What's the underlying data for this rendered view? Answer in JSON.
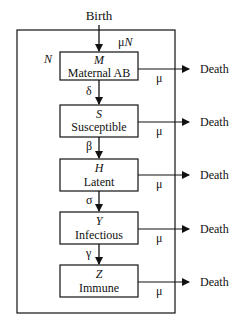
{
  "diagram": {
    "source_label": "Birth",
    "outer_label": "N",
    "birth_rate_label": "μN",
    "sink_label": "Death",
    "death_rate_label": "μ",
    "compartments": [
      {
        "symbol": "M",
        "name": "Maternal AB"
      },
      {
        "symbol": "S",
        "name": "Susceptible"
      },
      {
        "symbol": "H",
        "name": "Latent"
      },
      {
        "symbol": "Y",
        "name": "Infectious"
      },
      {
        "symbol": "Z",
        "name": "Immune"
      }
    ],
    "transitions": [
      {
        "from": "M",
        "to": "S",
        "rate": "δ"
      },
      {
        "from": "S",
        "to": "H",
        "rate": "β"
      },
      {
        "from": "H",
        "to": "Y",
        "rate": "σ"
      },
      {
        "from": "Y",
        "to": "Z",
        "rate": "γ"
      }
    ],
    "colors": {
      "stroke": "#111111",
      "background": "#ffffff"
    }
  }
}
